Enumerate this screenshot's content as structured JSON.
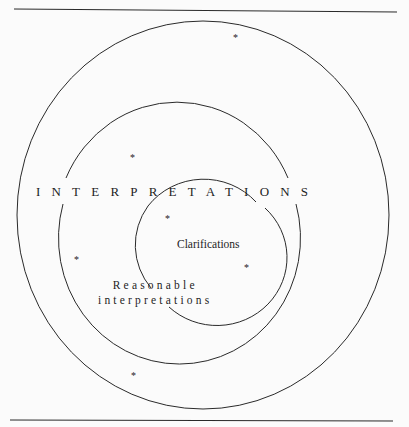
{
  "diagram": {
    "type": "nested-circles",
    "labels": {
      "outer": "INTERPRETATIONS",
      "middle_line1": "Reasonable",
      "middle_line2": "interpretations",
      "inner": "Clarifications"
    },
    "marker_glyph": "*",
    "markers": [
      {
        "region": "outer",
        "x": 236,
        "y": 36
      },
      {
        "region": "outer",
        "x": 133,
        "y": 156
      },
      {
        "region": "middle",
        "x": 168,
        "y": 217
      },
      {
        "region": "middle",
        "x": 77,
        "y": 258
      },
      {
        "region": "inner",
        "x": 247,
        "y": 266
      },
      {
        "region": "outer",
        "x": 134,
        "y": 374
      }
    ],
    "colors": {
      "stroke": "#2a2a2a",
      "text": "#1e1e1e",
      "background": "#fbfbfb"
    }
  }
}
